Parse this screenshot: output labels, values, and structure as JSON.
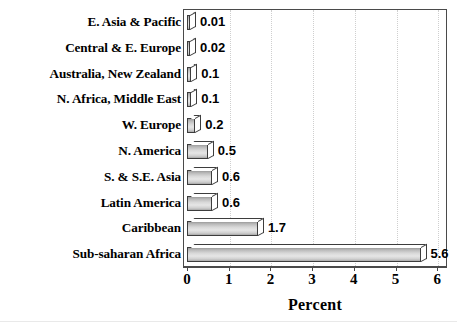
{
  "chart_data": {
    "type": "bar",
    "orientation": "horizontal",
    "title": "",
    "xlabel": "Percent",
    "ylabel": "",
    "xlim": [
      0,
      6
    ],
    "xticks": [
      "0",
      "1",
      "2",
      "3",
      "4",
      "5",
      "6"
    ],
    "grid": "vertical-dotted",
    "legend": "none",
    "categories": [
      "E. Asia & Pacific",
      "Central & E. Europe",
      "Australia, New Zealand",
      "N. Africa, Middle East",
      "W. Europe",
      "N. America",
      "S. & S.E. Asia",
      "Latin America",
      "Caribbean",
      "Sub-saharan Africa"
    ],
    "values": [
      0.01,
      0.02,
      0.1,
      0.1,
      0.2,
      0.5,
      0.6,
      0.6,
      1.7,
      5.6
    ],
    "value_labels": [
      "0.01",
      "0.02",
      "0.1",
      "0.1",
      "0.2",
      "0.5",
      "0.6",
      "0.6",
      "1.7",
      "5.6"
    ]
  },
  "style": {
    "bar_fill": "#d8d8d8",
    "bar_border": "#3d3d3d",
    "frame_color": "#4a4a4a",
    "gridline_color": "#cfcfcf",
    "text_color": "#000000",
    "background": "#ffffff"
  }
}
